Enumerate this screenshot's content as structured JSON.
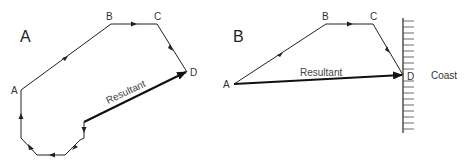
{
  "panel_a": {
    "title": "A",
    "points": {
      "A": "A",
      "B": "B",
      "C": "C",
      "D": "D"
    },
    "resultant_label": "Resultant"
  },
  "panel_b": {
    "title": "B",
    "points": {
      "A": "A",
      "B": "B",
      "C": "C",
      "D": "D"
    },
    "resultant_label": "Resultant",
    "coast_label": "Coast"
  },
  "colors": {
    "line": "#222222",
    "text": "#333333",
    "background": "#ffffff"
  }
}
